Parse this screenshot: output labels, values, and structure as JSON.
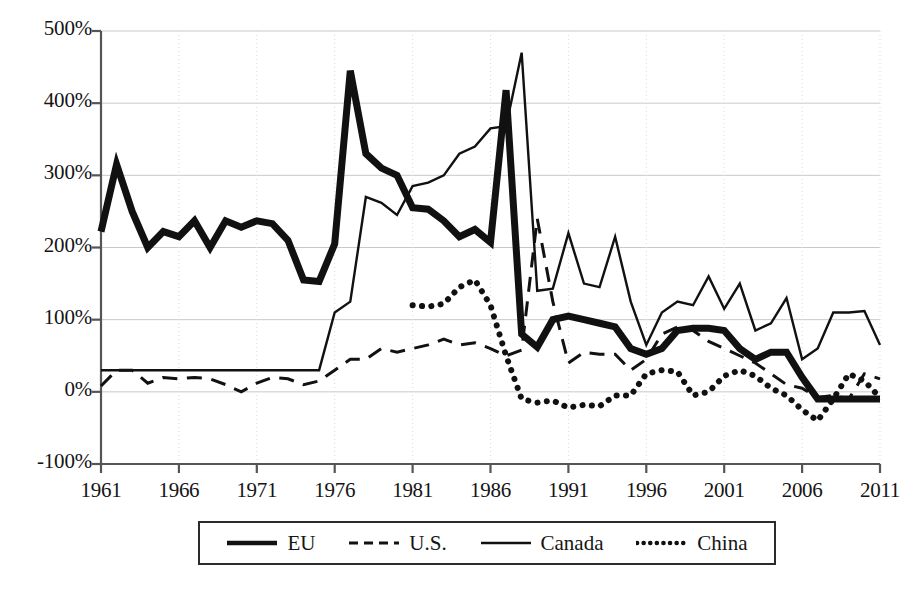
{
  "chart_data": {
    "type": "line",
    "title": "",
    "subtitle": "",
    "xlabel": "",
    "ylabel": "",
    "xlim": [
      1961,
      2011
    ],
    "ylim": [
      -100,
      500
    ],
    "y_tick_labels": [
      "500%",
      "400%",
      "300%",
      "200%",
      "100%",
      "0%",
      "-100%"
    ],
    "y_tick_values": [
      500,
      400,
      300,
      200,
      100,
      0,
      -100
    ],
    "x_tick_labels": [
      "1961",
      "1966",
      "1971",
      "1976",
      "1981",
      "1986",
      "1991",
      "1996",
      "2001",
      "2006",
      "2011"
    ],
    "x_tick_values": [
      1961,
      1966,
      1971,
      1976,
      1981,
      1986,
      1991,
      1996,
      2001,
      2006,
      2011
    ],
    "grid": "horizontal-solid-and-vertical-dotted",
    "legend_position": "below-plot-center",
    "series": [
      {
        "name": "EU",
        "style": "solid-thick",
        "color": "#111111",
        "width": 7,
        "x": [
          1961,
          1962,
          1963,
          1964,
          1965,
          1966,
          1967,
          1968,
          1969,
          1970,
          1971,
          1972,
          1973,
          1974,
          1975,
          1976,
          1977,
          1978,
          1979,
          1980,
          1981,
          1982,
          1983,
          1984,
          1985,
          1986,
          1987,
          1988,
          1989,
          1990,
          1991,
          1992,
          1993,
          1994,
          1995,
          1996,
          1997,
          1998,
          1999,
          2000,
          2001,
          2002,
          2003,
          2004,
          2005,
          2006,
          2007,
          2008,
          2009,
          2010,
          2011
        ],
        "values": [
          222,
          315,
          250,
          200,
          222,
          215,
          237,
          200,
          237,
          228,
          237,
          233,
          210,
          155,
          153,
          205,
          445,
          330,
          310,
          300,
          255,
          253,
          237,
          215,
          225,
          207,
          418,
          80,
          62,
          100,
          105,
          100,
          95,
          90,
          60,
          52,
          60,
          85,
          88,
          88,
          85,
          60,
          45,
          55,
          55,
          20,
          -10,
          -10,
          -10,
          -10,
          -10
        ]
      },
      {
        "name": "U.S.",
        "style": "dashed",
        "color": "#111111",
        "width": 3,
        "x": [
          1961,
          1962,
          1963,
          1964,
          1965,
          1966,
          1967,
          1968,
          1969,
          1970,
          1971,
          1972,
          1973,
          1974,
          1975,
          1976,
          1977,
          1978,
          1979,
          1980,
          1981,
          1982,
          1983,
          1984,
          1985,
          1986,
          1987,
          1988,
          1989,
          1990,
          1991,
          1992,
          1993,
          1994,
          1995,
          1996,
          1997,
          1998,
          1999,
          2000,
          2001,
          2002,
          2003,
          2004,
          2005,
          2006,
          2007,
          2008,
          2009,
          2010,
          2011
        ],
        "values": [
          8,
          30,
          30,
          12,
          20,
          18,
          20,
          18,
          10,
          0,
          12,
          20,
          18,
          10,
          15,
          30,
          45,
          45,
          60,
          55,
          60,
          65,
          73,
          65,
          68,
          60,
          50,
          58,
          240,
          125,
          40,
          55,
          52,
          52,
          30,
          45,
          80,
          90,
          85,
          70,
          60,
          50,
          40,
          25,
          10,
          5,
          -8,
          -5,
          -10,
          25,
          18
        ]
      },
      {
        "name": "Canada",
        "style": "solid-thin",
        "color": "#111111",
        "width": 2.4,
        "x": [
          1961,
          1962,
          1963,
          1964,
          1965,
          1966,
          1967,
          1968,
          1969,
          1970,
          1971,
          1972,
          1973,
          1974,
          1975,
          1976,
          1977,
          1978,
          1979,
          1980,
          1981,
          1982,
          1983,
          1984,
          1985,
          1986,
          1987,
          1988,
          1989,
          1990,
          1991,
          1992,
          1993,
          1994,
          1995,
          1996,
          1997,
          1998,
          1999,
          2000,
          2001,
          2002,
          2003,
          2004,
          2005,
          2006,
          2007,
          2008,
          2009,
          2010,
          2011
        ],
        "values": [
          30,
          30,
          30,
          30,
          30,
          30,
          30,
          30,
          30,
          30,
          30,
          30,
          30,
          30,
          30,
          110,
          125,
          270,
          262,
          245,
          285,
          290,
          300,
          330,
          340,
          365,
          368,
          470,
          140,
          143,
          220,
          150,
          145,
          215,
          125,
          65,
          110,
          125,
          120,
          160,
          115,
          150,
          85,
          95,
          130,
          45,
          60,
          110,
          110,
          112,
          65
        ]
      },
      {
        "name": "China",
        "style": "dotted",
        "color": "#111111",
        "width": 6,
        "x": [
          1981,
          1982,
          1983,
          1984,
          1985,
          1986,
          1987,
          1988,
          1989,
          1990,
          1991,
          1992,
          1993,
          1994,
          1995,
          1996,
          1997,
          1998,
          1999,
          2000,
          2001,
          2002,
          2003,
          2004,
          2005,
          2006,
          2007,
          2008,
          2009,
          2010,
          2011
        ],
        "values": [
          120,
          118,
          122,
          145,
          155,
          120,
          50,
          -10,
          -15,
          -12,
          -22,
          -18,
          -20,
          -5,
          -5,
          25,
          30,
          28,
          -5,
          0,
          22,
          30,
          22,
          5,
          -5,
          -25,
          -40,
          -10,
          25,
          15,
          -8
        ]
      }
    ]
  },
  "legend": {
    "items": [
      {
        "label": "EU",
        "style": "solid-thick"
      },
      {
        "label": "U.S.",
        "style": "dashed"
      },
      {
        "label": "Canada",
        "style": "solid-thin"
      },
      {
        "label": "China",
        "style": "dotted"
      }
    ]
  },
  "colors": {
    "line": "#111111",
    "gridline_major": "#c9c9c9",
    "gridline_minor": "#d9d9d9",
    "axis": "#555555",
    "background": "#ffffff"
  }
}
